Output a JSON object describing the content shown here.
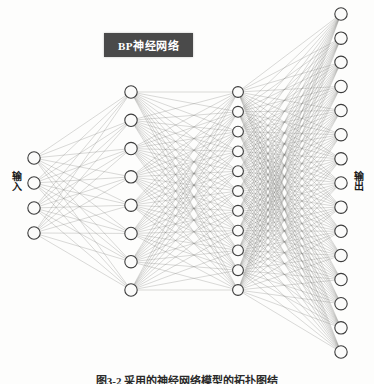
{
  "figure": {
    "title_box": {
      "label": "BP神经网络",
      "background_color": "#4a4a4a",
      "text_color": "#ffffff",
      "x": 104,
      "y": 33,
      "width": 89,
      "height": 24,
      "font_size": 11
    },
    "input_label": {
      "text": "输入",
      "x": 10,
      "y": 172,
      "font_size": 10
    },
    "output_label": {
      "text": "输出",
      "x": 352,
      "y": 172,
      "font_size": 10
    },
    "caption": {
      "text": "图3-2 采用的神经网络模型的拓扑图结",
      "y": 372,
      "font_size": 11
    },
    "style": {
      "node_fill": "#fbfbfa",
      "node_stroke": "#3c3c3c",
      "node_stroke_width": 1.1,
      "edge_color": "#7a7a78",
      "edge_width": 0.33,
      "edge_opacity": 0.85,
      "background": "#fdfdfc"
    },
    "network": {
      "name": "BP neural network topology",
      "fully_connected": true,
      "layer_count": 4,
      "layers": [
        {
          "name": "input-layer",
          "role": "input",
          "node_count": 4,
          "x": 34,
          "y_start": 158,
          "y_end": 233,
          "radius": 6.2
        },
        {
          "name": "hidden-layer-1",
          "role": "hidden",
          "node_count": 8,
          "x": 131,
          "y_start": 92,
          "y_end": 290,
          "radius": 6.2
        },
        {
          "name": "hidden-layer-2",
          "role": "hidden",
          "node_count": 11,
          "x": 238,
          "y_start": 92,
          "y_end": 290,
          "radius": 5.4
        },
        {
          "name": "output-layer",
          "role": "output",
          "node_count": 15,
          "x": 341,
          "y_start": 14,
          "y_end": 352,
          "radius": 6.2
        }
      ]
    }
  }
}
